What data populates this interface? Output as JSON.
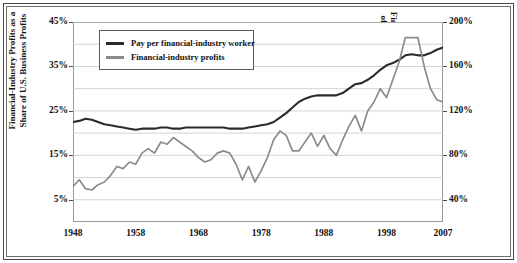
{
  "chart_data": {
    "type": "line",
    "title": "",
    "subtitle": "",
    "xlabel": "",
    "ylabel": "Financial-Industry Profits as a Share of U.S. Business Profits",
    "y2label": "Pay per Worker in the U.S. Financial Sector as a Percentage of Average U.S. Compensation",
    "grid": true,
    "legend_position": "top-left-inside",
    "xlim": [
      1948,
      2007
    ],
    "ylim": [
      0,
      45
    ],
    "y2lim": [
      20,
      200
    ],
    "xticks": [
      1948,
      1958,
      1968,
      1978,
      1988,
      1998,
      2007
    ],
    "xticklabels": [
      "1948",
      "1958",
      "1968",
      "1978",
      "1988",
      "1998",
      "2007"
    ],
    "yticks": [
      5,
      15,
      25,
      35,
      45
    ],
    "yticklabels": [
      "5%",
      "15%",
      "25%",
      "35%",
      "45%"
    ],
    "y2ticks": [
      40,
      80,
      120,
      160,
      200
    ],
    "y2ticklabels": [
      "40%",
      "80%",
      "120%",
      "160%",
      "200%"
    ],
    "gridline_values": [
      5,
      10,
      15,
      20,
      25,
      30,
      35,
      40,
      45
    ],
    "x": [
      1948,
      1949,
      1950,
      1951,
      1952,
      1953,
      1954,
      1955,
      1956,
      1957,
      1958,
      1959,
      1960,
      1961,
      1962,
      1963,
      1964,
      1965,
      1966,
      1967,
      1968,
      1969,
      1970,
      1971,
      1972,
      1973,
      1974,
      1975,
      1976,
      1977,
      1978,
      1979,
      1980,
      1981,
      1982,
      1983,
      1984,
      1985,
      1986,
      1987,
      1988,
      1989,
      1990,
      1991,
      1992,
      1993,
      1994,
      1995,
      1996,
      1997,
      1998,
      1999,
      2000,
      2001,
      2002,
      2003,
      2004,
      2005,
      2006,
      2007
    ],
    "series": [
      {
        "name": "Pay per financial-industry worker",
        "axis": "right",
        "color": "#2b2b2b",
        "units": "percent of average U.S. compensation",
        "values": [
          110,
          111,
          113,
          112,
          110,
          108,
          107,
          106,
          105,
          104,
          103,
          104,
          104,
          104,
          105,
          105,
          104,
          104,
          105,
          105,
          105,
          105,
          105,
          105,
          105,
          104,
          104,
          104,
          105,
          106,
          107,
          108,
          110,
          114,
          118,
          123,
          128,
          131,
          133,
          134,
          134,
          134,
          134,
          136,
          140,
          144,
          145,
          148,
          152,
          157,
          161,
          163,
          166,
          170,
          171,
          170,
          170,
          172,
          175,
          177
        ]
      },
      {
        "name": "Financial-industry profits",
        "axis": "left",
        "color": "#8c8c8c",
        "units": "percent share of U.S. business profits",
        "values": [
          8.0,
          9.5,
          7.5,
          7.2,
          8.4,
          9.0,
          10.5,
          12.5,
          12.0,
          13.5,
          13.0,
          15.5,
          16.5,
          15.5,
          18.0,
          17.5,
          19.0,
          18.0,
          17.0,
          16.0,
          14.5,
          13.5,
          14.0,
          15.5,
          16.0,
          15.5,
          13.0,
          9.5,
          12.5,
          9.0,
          11.5,
          14.5,
          18.5,
          20.5,
          19.5,
          16.0,
          16.0,
          18.0,
          20.0,
          17.0,
          19.5,
          16.5,
          15.0,
          18.5,
          21.5,
          24.0,
          20.5,
          25.0,
          27.0,
          30.0,
          28.0,
          32.0,
          36.0,
          41.5,
          41.5,
          41.5,
          35.0,
          30.0,
          27.5,
          27.0
        ]
      }
    ],
    "annotations": []
  },
  "legend": {
    "items": [
      {
        "label": "Pay per financial-industry worker",
        "color": "#2b2b2b"
      },
      {
        "label": "Financial-industry profits",
        "color": "#8c8c8c"
      }
    ]
  },
  "axes": {
    "left": {
      "title": "Financial-Industry Profits as a Share of U.S. Business Profits",
      "ticks": [
        "45%",
        "35%",
        "25%",
        "15%",
        "5%"
      ]
    },
    "right": {
      "title": "Pay per Worker in the U.S. Financial Sector as a Percentage of Average U.S. Compensation",
      "ticks": [
        "200%",
        "160%",
        "120%",
        "80%",
        "40%"
      ]
    },
    "bottom": {
      "ticks": [
        "1948",
        "1958",
        "1968",
        "1978",
        "1988",
        "1998",
        "2007"
      ]
    }
  }
}
